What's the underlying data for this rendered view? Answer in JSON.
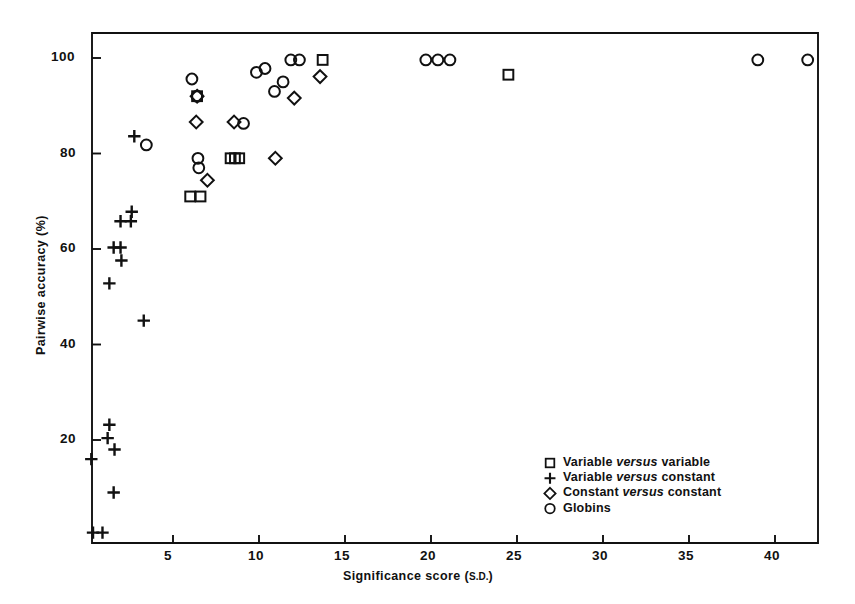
{
  "chart_data": {
    "type": "scatter",
    "title": "",
    "xlabel": "Significance score (s.d.)",
    "ylabel": "Pairwise accuracy (%)",
    "xlim": [
      0,
      43.5
    ],
    "ylim": [
      0,
      106
    ],
    "xticks": [
      5,
      10,
      15,
      20,
      25,
      30,
      35,
      40
    ],
    "yticks": [
      20,
      40,
      60,
      80,
      100
    ],
    "xtick_labels": [
      "5",
      "10",
      "15",
      "20",
      "25",
      "30",
      "35",
      "40"
    ],
    "ytick_labels": [
      "20",
      "40",
      "60",
      "80",
      "100"
    ],
    "grid": false,
    "legend_position": "bottom-right",
    "series": [
      {
        "name": "Variable versus variable",
        "marker": "square",
        "points": [
          [
            6.0,
            71.0
          ],
          [
            6.6,
            71.0
          ],
          [
            6.4,
            92.0
          ],
          [
            8.35,
            79.0
          ],
          [
            8.6,
            79.0
          ],
          [
            8.85,
            79.0
          ],
          [
            13.7,
            99.6
          ],
          [
            24.5,
            96.5
          ]
        ]
      },
      {
        "name": "Variable versus constant",
        "marker": "plus",
        "points": [
          [
            0.25,
            16.0
          ],
          [
            0.35,
            0.6
          ],
          [
            0.9,
            0.6
          ],
          [
            1.3,
            23.2
          ],
          [
            1.2,
            20.4
          ],
          [
            1.6,
            18.0
          ],
          [
            1.55,
            9.0
          ],
          [
            1.3,
            52.8
          ],
          [
            1.55,
            60.3
          ],
          [
            1.95,
            60.3
          ],
          [
            2.0,
            57.6
          ],
          [
            1.95,
            65.8
          ],
          [
            2.55,
            65.8
          ],
          [
            2.6,
            67.8
          ],
          [
            2.75,
            83.6
          ],
          [
            3.3,
            45.0
          ]
        ]
      },
      {
        "name": "Constant versus constant",
        "marker": "diamond",
        "points": [
          [
            6.4,
            92.0
          ],
          [
            6.35,
            86.6
          ],
          [
            7.0,
            74.4
          ],
          [
            8.55,
            86.6
          ],
          [
            10.95,
            79.0
          ],
          [
            12.05,
            91.6
          ],
          [
            13.55,
            96.1
          ]
        ]
      },
      {
        "name": "Globins",
        "marker": "circle",
        "points": [
          [
            3.45,
            81.8
          ],
          [
            6.1,
            95.6
          ],
          [
            6.4,
            92.0
          ],
          [
            6.45,
            79.0
          ],
          [
            6.5,
            77.0
          ],
          [
            9.1,
            86.3
          ],
          [
            9.85,
            97.0
          ],
          [
            10.35,
            97.8
          ],
          [
            10.9,
            93.0
          ],
          [
            11.4,
            95.0
          ],
          [
            11.85,
            99.6
          ],
          [
            12.35,
            99.6
          ],
          [
            19.7,
            99.6
          ],
          [
            20.4,
            99.6
          ],
          [
            21.1,
            99.6
          ],
          [
            39.0,
            99.6
          ],
          [
            41.9,
            99.6
          ]
        ]
      }
    ]
  },
  "legend": {
    "items": [
      {
        "marker": "square",
        "pre": "Variable ",
        "em": "versus",
        "post": " variable"
      },
      {
        "marker": "plus",
        "pre": "Variable ",
        "em": "versus",
        "post": " constant"
      },
      {
        "marker": "diamond",
        "pre": "Constant ",
        "em": "versus",
        "post": " constant"
      },
      {
        "marker": "circle",
        "pre": "Globins",
        "em": "",
        "post": ""
      }
    ]
  },
  "colors": {
    "ink": "#111111",
    "background": "#ffffff"
  }
}
